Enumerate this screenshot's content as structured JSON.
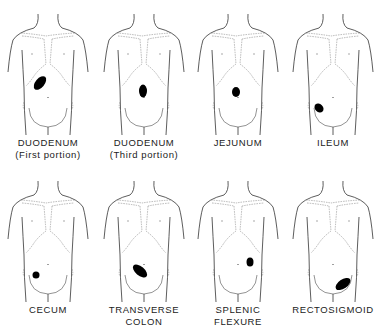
{
  "figure": {
    "panels": [
      {
        "label1": "DUODENUM",
        "label2": "(First portion)",
        "lesion": {
          "cx": 40,
          "cy": 83,
          "rx": 4.5,
          "ry": 8,
          "rot": 40
        }
      },
      {
        "label1": "DUODENUM",
        "label2": "(Third portion)",
        "lesion": {
          "cx": 47,
          "cy": 91,
          "rx": 4,
          "ry": 6.5,
          "rot": 0
        }
      },
      {
        "label1": "JEJUNUM",
        "label2": "",
        "lesion": {
          "cx": 46,
          "cy": 92,
          "rx": 4,
          "ry": 5,
          "rot": 0
        }
      },
      {
        "label1": "ILEUM",
        "label2": "",
        "lesion": {
          "cx": 34,
          "cy": 108,
          "rx": 4,
          "ry": 5,
          "rot": -45
        }
      },
      {
        "label1": "CECUM",
        "label2": "",
        "lesion": {
          "cx": 36,
          "cy": 108,
          "rx": 3.5,
          "ry": 3.5,
          "rot": 0
        }
      },
      {
        "label1": "TRANSVERSE",
        "label2": "COLON",
        "lesion": {
          "cx": 44,
          "cy": 104,
          "rx": 4.5,
          "ry": 8.5,
          "rot": -50
        }
      },
      {
        "label1": "SPLENIC",
        "label2": "FLEXURE",
        "lesion": {
          "cx": 60,
          "cy": 95,
          "rx": 3.5,
          "ry": 4.5,
          "rot": 0
        }
      },
      {
        "label1": "RECTOSIGMOID",
        "label2": "",
        "lesion": {
          "cx": 58,
          "cy": 117,
          "rx": 4.5,
          "ry": 8.5,
          "rot": 55
        }
      }
    ]
  }
}
